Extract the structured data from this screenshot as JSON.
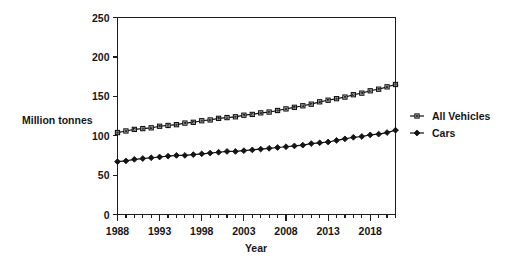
{
  "chart_data": {
    "type": "line",
    "title": "",
    "xlabel": "Year",
    "ylabel": "Million tonnes",
    "xlim": [
      1988,
      2021
    ],
    "ylim": [
      0,
      250
    ],
    "ytick_values": [
      0,
      50,
      100,
      150,
      200,
      250
    ],
    "ytick_labels": [
      "0",
      "50",
      "100",
      "150",
      "200",
      "250"
    ],
    "xtick_labels": [
      "1988",
      "1993",
      "1998",
      "2003",
      "2008",
      "2013",
      "2018"
    ],
    "xtick_label_values": [
      1988,
      1993,
      1998,
      2003,
      2008,
      2013,
      2018
    ],
    "grid": false,
    "legend_position": "right",
    "x": [
      1988,
      1989,
      1990,
      1991,
      1992,
      1993,
      1994,
      1995,
      1996,
      1997,
      1998,
      1999,
      2000,
      2001,
      2002,
      2003,
      2004,
      2005,
      2006,
      2007,
      2008,
      2009,
      2010,
      2011,
      2012,
      2013,
      2014,
      2015,
      2016,
      2017,
      2018,
      2019,
      2020,
      2021
    ],
    "series": [
      {
        "name": "All Vehicles",
        "marker": "open-square",
        "values": [
          104,
          106,
          108,
          109,
          110,
          112,
          113,
          114,
          116,
          117,
          119,
          120,
          122,
          123,
          124,
          126,
          127,
          129,
          130,
          132,
          134,
          136,
          138,
          140,
          143,
          145,
          147,
          149,
          152,
          154,
          157,
          159,
          162,
          165
        ]
      },
      {
        "name": "Cars",
        "marker": "filled-diamond",
        "values": [
          67,
          68,
          70,
          71,
          72,
          73,
          74,
          75,
          75,
          76,
          77,
          78,
          79,
          80,
          80,
          81,
          82,
          83,
          84,
          85,
          86,
          87,
          88,
          90,
          91,
          92,
          94,
          96,
          98,
          99,
          101,
          102,
          104,
          107
        ]
      }
    ]
  },
  "legend": {
    "entries": [
      {
        "label": "All Vehicles",
        "marker": "open-square-icon"
      },
      {
        "label": "Cars",
        "marker": "filled-diamond-icon"
      }
    ]
  },
  "labels": {
    "y_axis_title": "Million tonnes",
    "x_axis_title": "Year"
  }
}
